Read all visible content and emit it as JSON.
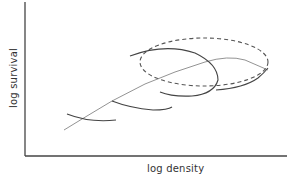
{
  "figure": {
    "type": "schematic",
    "x_axis_label": "log density",
    "y_axis_label": "log survival",
    "colors": {
      "axis": "#444444",
      "curves": "#444444",
      "trajectory": "#777777",
      "ellipse": "#555555",
      "background": "#ffffff"
    },
    "elements": {
      "axes": "L-shaped axes, no ticks",
      "trajectory": "thin rising line from lower-left to upper-right, leveling off and dipping slightly at right end",
      "curves": [
        "short arc crossing trajectory near lower-left",
        "arc crossing trajectory near lower-middle",
        "large looping arc at upper-middle",
        "arc at right rising toward ellipse edge"
      ],
      "ellipse": "dashed ellipse enclosing the upper region of the trajectory"
    }
  }
}
